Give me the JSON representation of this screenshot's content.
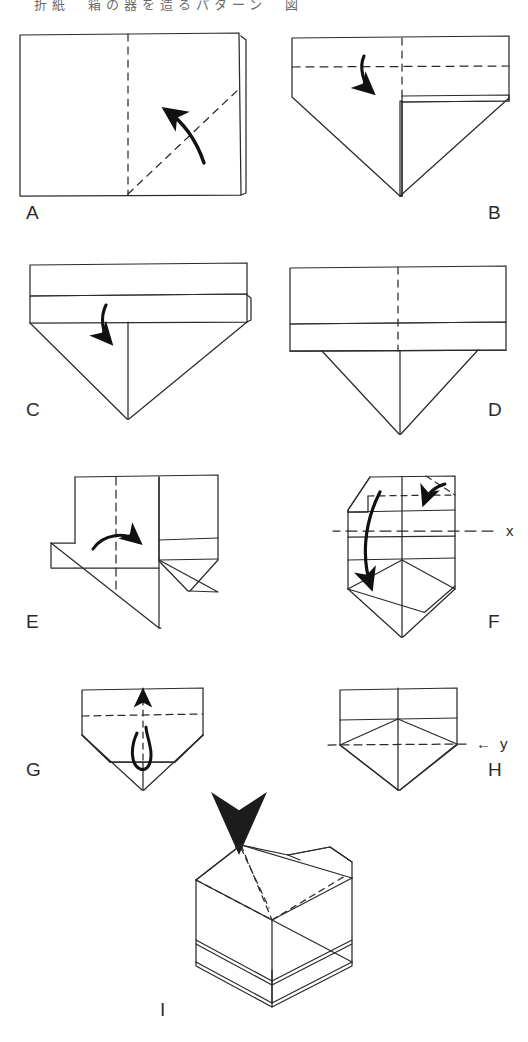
{
  "document": {
    "type": "origami-instruction-diagram",
    "title_strip": "折紙　箱の器を造るパターン　図",
    "page_background": "#ffffff",
    "ink_color": "#2b2b2b"
  },
  "steps": [
    {
      "id": "A",
      "label": "A",
      "label_pos": {
        "x": 26,
        "y": 203
      },
      "caption": "Rectangle with vertical centre crease and diagonal valley fold; arrow folds lower-right corner up-left."
    },
    {
      "id": "B",
      "label": "B",
      "label_pos": {
        "x": 488,
        "y": 203
      },
      "caption": "Top band with horizontal dashed fold line; curved arrow folds band down."
    },
    {
      "id": "C",
      "label": "C",
      "label_pos": {
        "x": 26,
        "y": 400
      },
      "caption": "Two stacked bands above the point; arrow folds the lower band down."
    },
    {
      "id": "D",
      "label": "D",
      "label_pos": {
        "x": 488,
        "y": 400
      },
      "caption": "Resulting shape: two bands with vertical dashed centre line and triangular point."
    },
    {
      "id": "E",
      "label": "E",
      "label_pos": {
        "x": 26,
        "y": 612
      },
      "caption": "Vertical dash-dot centre crease; arrow folds the left half across to the right."
    },
    {
      "id": "F",
      "label": "F",
      "label_pos": {
        "x": 488,
        "y": 612
      },
      "caption": "Narrow folded unit; small arrow tucks the top-right corner, long arrow folds flap downward."
    },
    {
      "id": "G",
      "label": "G",
      "label_pos": {
        "x": 26,
        "y": 760
      },
      "caption": "Arrow folds the small tab upward along the dashed line."
    },
    {
      "id": "H",
      "label": "H",
      "label_pos": {
        "x": 488,
        "y": 760
      },
      "caption": "Completed flat unit with horizontal reference line y."
    },
    {
      "id": "I",
      "label": "I",
      "label_pos": {
        "x": 158,
        "y": 1000
      },
      "caption": "Finished three-dimensional box; large arrow presses the top down to open the box."
    }
  ],
  "reference_marks": [
    {
      "name": "x",
      "label": "x",
      "pos": {
        "x": 506,
        "y": 530
      },
      "line": "horizontal dash-dot across step F"
    },
    {
      "name": "y",
      "label": "y",
      "arrow": "←",
      "pos": {
        "x": 500,
        "y": 744
      },
      "line": "horizontal dashed across step H"
    }
  ],
  "legend": {
    "solid_line": "cut / visible edge",
    "dashed_line": "valley fold crease",
    "dash_dot_line": "reference axis",
    "arrow": "fold direction"
  }
}
